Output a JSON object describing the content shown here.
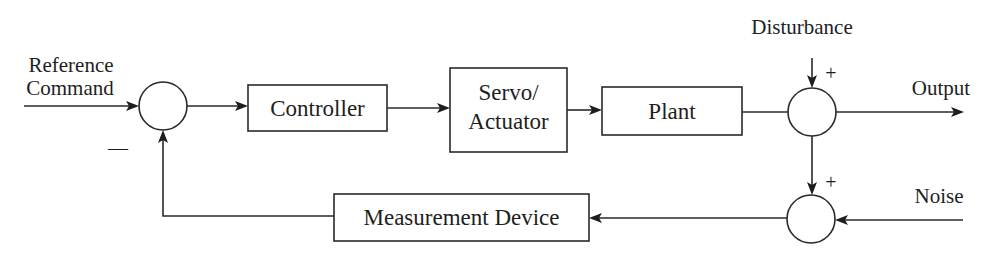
{
  "diagram": {
    "type": "block-diagram",
    "inputs": {
      "reference": {
        "line1": "Reference",
        "line2": "Command"
      },
      "disturbance": "Disturbance",
      "noise": "Noise"
    },
    "output": "Output",
    "blocks": {
      "controller": "Controller",
      "servo": {
        "line1": "Servo/",
        "line2": "Actuator"
      },
      "plant": "Plant",
      "measurement": "Measurement Device"
    },
    "signs": {
      "feedback_minus": "—",
      "disturbance_plus": "+",
      "noise_path_plus": "+"
    },
    "junctions": [
      "reference-summing-junction",
      "disturbance-summing-junction",
      "noise-summing-junction"
    ],
    "connections": [
      {
        "from": "Reference Command",
        "to": "reference-summing-junction",
        "arrow": true
      },
      {
        "from": "reference-summing-junction",
        "to": "Controller",
        "arrow": true
      },
      {
        "from": "Controller",
        "to": "Servo/Actuator",
        "arrow": true
      },
      {
        "from": "Servo/Actuator",
        "to": "Plant",
        "arrow": true
      },
      {
        "from": "Plant",
        "to": "disturbance-summing-junction",
        "arrow": false
      },
      {
        "from": "Disturbance",
        "to": "disturbance-summing-junction",
        "arrow": true,
        "sign": "+"
      },
      {
        "from": "disturbance-summing-junction",
        "to": "Output",
        "arrow": true
      },
      {
        "from": "disturbance-summing-junction",
        "to": "noise-summing-junction",
        "arrow": true,
        "sign": "+"
      },
      {
        "from": "Noise",
        "to": "noise-summing-junction",
        "arrow": true
      },
      {
        "from": "noise-summing-junction",
        "to": "Measurement Device",
        "arrow": true
      },
      {
        "from": "Measurement Device",
        "to": "reference-summing-junction",
        "arrow": true,
        "sign": "-"
      }
    ],
    "colors": {
      "line": "#2a2a2a",
      "text": "#1e1e1e",
      "background": "#ffffff"
    }
  }
}
